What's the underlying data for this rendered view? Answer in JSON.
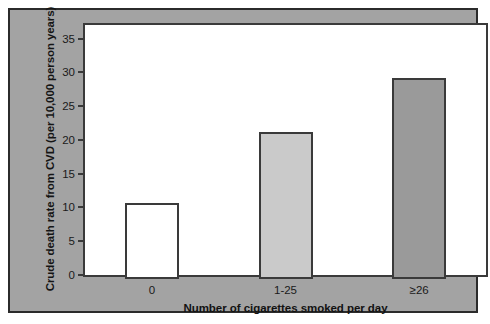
{
  "chart_data": {
    "type": "bar",
    "title": "",
    "subtitle": "",
    "xlabel": "Number of cigarettes smoked per day",
    "ylabel": "Crude death rate from CVD (per 10,000 person years)",
    "categories": [
      "0",
      "1-25",
      "≥26"
    ],
    "values": [
      11.3,
      21.7,
      29.8
    ],
    "ylim": [
      0,
      37
    ],
    "yticks": [
      0,
      5,
      10,
      15,
      20,
      25,
      30,
      35
    ],
    "ytick_labels": [
      "0",
      "5",
      "10",
      "15",
      "20",
      "25",
      "30",
      "35"
    ],
    "grid": false,
    "legend": "none",
    "bar_colors": [
      "#ffffff",
      "#cacaca",
      "#9a9a9a"
    ],
    "bar_edge_color": "#3a3a3a",
    "panel_background": "#a3a3a3",
    "plot_background": "#ffffff"
  }
}
